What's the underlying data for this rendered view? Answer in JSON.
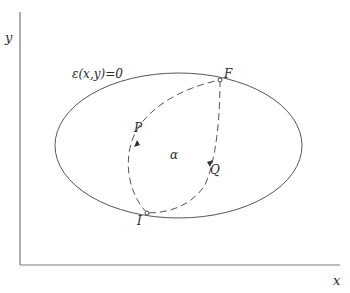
{
  "axes": {
    "x_label": "x",
    "y_label": "y"
  },
  "curve": {
    "equation_label": "ε(x,y)=0"
  },
  "points": {
    "initial": "I",
    "final": "F"
  },
  "paths": {
    "path_p_label": "P",
    "path_q_label": "Q"
  },
  "region": {
    "label": "α"
  },
  "colors": {
    "line": "#555555",
    "axis": "#7a7a7a",
    "text": "#2a2a2a"
  }
}
